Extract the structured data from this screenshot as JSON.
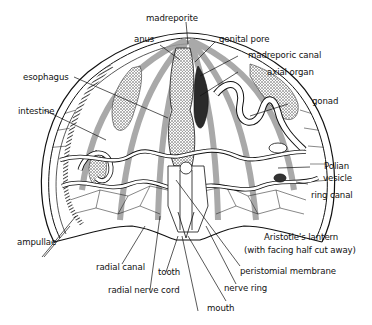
{
  "diagram": {
    "colors": {
      "ink": "#111111",
      "stripe": "#9a9a9a",
      "background": "#ffffff"
    },
    "labels": {
      "madreporite": "madreporite",
      "anus": "anus",
      "genital_pore": "genital pore",
      "madreporic_canal": "madreporic canal",
      "axial_organ": "axial organ",
      "esophagus": "esophagus",
      "intestine": "intestine",
      "gonad": "gonad",
      "polian_vesicle_1": "Polian",
      "polian_vesicle_2": "vesicle",
      "ring_canal": "ring canal",
      "ampullae": "ampullae",
      "aristotles_lantern_1": "Aristotle's lantern",
      "aristotles_lantern_2": "(with facing half cut away)",
      "peristomial_membrane": "peristomial membrane",
      "radial_canal": "radial canal",
      "tooth": "tooth",
      "nerve_ring": "nerve ring",
      "radial_nerve_cord": "radial nerve cord",
      "mouth": "mouth"
    }
  }
}
